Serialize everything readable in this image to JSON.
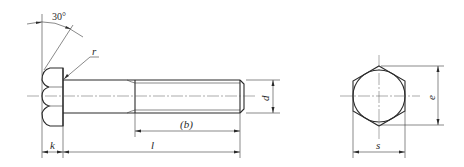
{
  "drawing": {
    "title": "Hexagon head bolt",
    "views": [
      "side-view",
      "end-view"
    ],
    "labels": {
      "angle": "30°",
      "radius": "r",
      "thread_length": "(b)",
      "diameter": "d",
      "head_height": "k",
      "length": "l",
      "width_across_flats": "s",
      "width_across_corners": "e"
    }
  }
}
